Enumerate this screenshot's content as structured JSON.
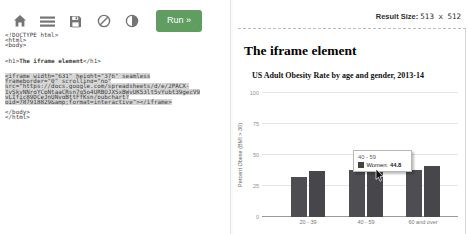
{
  "toolbar": {
    "run_label": "Run »",
    "icons": [
      {
        "name": "home-icon"
      },
      {
        "name": "menu-icon"
      },
      {
        "name": "save-icon"
      },
      {
        "name": "ban-icon"
      },
      {
        "name": "contrast-icon"
      }
    ]
  },
  "result_bar": {
    "label": "Result Size:",
    "value": "513 x 512"
  },
  "editor": {
    "lines": [
      {
        "segments": [
          {
            "text": "<!DOCTYPE html>"
          }
        ]
      },
      {
        "segments": [
          {
            "text": "<html>"
          }
        ]
      },
      {
        "segments": [
          {
            "text": "<body>"
          }
        ]
      },
      {
        "segments": [
          {
            "text": ""
          }
        ]
      },
      {
        "segments": [
          {
            "text": ""
          }
        ]
      },
      {
        "segments": [
          {
            "text": "<h1>"
          },
          {
            "text": "The iframe element",
            "bold": true
          },
          {
            "text": "</h1>"
          }
        ]
      },
      {
        "segments": [
          {
            "text": ""
          }
        ]
      },
      {
        "segments": [
          {
            "text": ""
          }
        ]
      },
      {
        "highlight": true,
        "segments": [
          {
            "text": "<iframe width=\"631\" height=\"376\" seamless"
          }
        ]
      },
      {
        "highlight": true,
        "segments": [
          {
            "text": "frameborder=\"0\" scrolling=\"no\""
          }
        ]
      },
      {
        "highlight": true,
        "segments": [
          {
            "text": "src=\"https://docs.google.com/spreadsheets/d/e/2PACX-"
          }
        ]
      },
      {
        "highlight": true,
        "segments": [
          {
            "text": "1vSkvNNrgYCpNtaaCRsn7g5o4URBOJXSxBWvUK53lt5vYubt39gecV9"
          }
        ]
      },
      {
        "highlight": true,
        "segments": [
          {
            "text": "yLIfic89DCeJnUNvgBttFfKsn/pubchart?"
          }
        ]
      },
      {
        "highlight": true,
        "segments": [
          {
            "text": "oid=787918829&amp;format=interactive\"></iframe>"
          }
        ]
      },
      {
        "segments": [
          {
            "text": ""
          }
        ]
      },
      {
        "segments": [
          {
            "text": "</body>"
          }
        ]
      },
      {
        "segments": [
          {
            "text": "</html>"
          }
        ]
      }
    ]
  },
  "result": {
    "heading": "The iframe element"
  },
  "chart_data": {
    "type": "bar",
    "title": "US Adult Obesity Rate by age and gender, 2013-14",
    "categories": [
      "20 - 39",
      "40 - 59",
      "60 and over"
    ],
    "series": [
      {
        "name": "Men",
        "color": "#4e4e52",
        "values": [
          32,
          38.3,
          38
        ]
      },
      {
        "name": "Women",
        "color": "#47474b",
        "values": [
          37,
          44.8,
          41
        ]
      }
    ],
    "xlabel": "",
    "ylabel": "Percent Obese (BMI > 30)",
    "ylim": [
      0,
      100
    ],
    "yticks": [
      0,
      25,
      50,
      75,
      100
    ],
    "grid": true,
    "legend_position": "none",
    "tooltip": {
      "category": "40 - 59",
      "series_label": "Women:",
      "value": "44.8",
      "swatch_color": "#434343"
    }
  },
  "colors": {
    "run_button_green": "#5f9e60",
    "code_highlight": "#d6d6d6",
    "icon_gray": "#757575",
    "gridline": "#e4e4e4"
  }
}
